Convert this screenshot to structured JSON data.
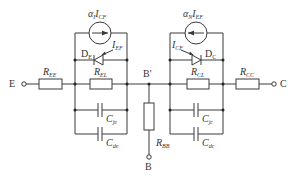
{
  "diagram": {
    "type": "circuit",
    "terminals": {
      "emitter": "E",
      "collector": "C",
      "base": "B",
      "internal_base": "B'"
    },
    "left_branch": {
      "current_source": {
        "symbol": "α",
        "sub": "I",
        "current": "I",
        "current_sub": "CF",
        "direction": "right"
      },
      "diode": {
        "label": "D",
        "label_sub": "E",
        "current": "I",
        "current_sub": "EF"
      },
      "resistor": {
        "label": "R",
        "sub": "EL"
      },
      "cap1": {
        "label": "C",
        "sub": "je"
      },
      "cap2": {
        "label": "C",
        "sub": "de"
      }
    },
    "right_branch": {
      "current_source": {
        "symbol": "α",
        "sub": "N",
        "current": "I",
        "current_sub": "EF",
        "direction": "left"
      },
      "diode": {
        "label": "D",
        "label_sub": "C",
        "current": "I",
        "current_sub": "CF"
      },
      "resistor": {
        "label": "R",
        "sub": "CL"
      },
      "cap1": {
        "label": "C",
        "sub": "jc"
      },
      "cap2": {
        "label": "C",
        "sub": "dc"
      }
    },
    "series_resistors": {
      "emitter": {
        "label": "R",
        "sub": "EE"
      },
      "collector": {
        "label": "R",
        "sub": "CC"
      },
      "base": {
        "label": "R",
        "sub": "BB"
      }
    },
    "colors": {
      "line": "#3a3a3a",
      "text": "#333333",
      "background": "#ffffff"
    }
  }
}
